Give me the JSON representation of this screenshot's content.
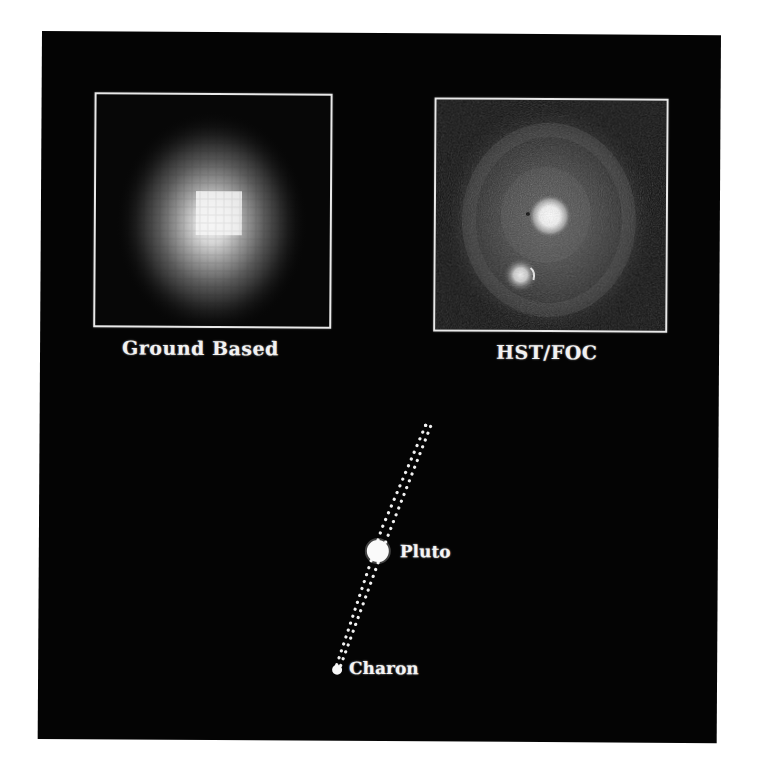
{
  "figure": {
    "panels": [
      {
        "id": "ground",
        "caption": "Ground Based",
        "description": "Blurred pixelated single blob of Pluto and Charon"
      },
      {
        "id": "hst",
        "caption": "HST/FOC",
        "description": "Resolved image showing Pluto (brighter, upper) and Charon (fainter, lower-left) with diffraction halo"
      }
    ],
    "diagram": {
      "bodies": [
        {
          "name": "Pluto",
          "label": "Pluto"
        },
        {
          "name": "Charon",
          "label": "Charon"
        }
      ],
      "orbit_style": "dotted ellipse (highly inclined, nearly edge-on)"
    },
    "colors": {
      "background": "#040404",
      "page": "#ffffff",
      "frame": "#e9e9e9",
      "text": "#f2f2f2"
    }
  }
}
